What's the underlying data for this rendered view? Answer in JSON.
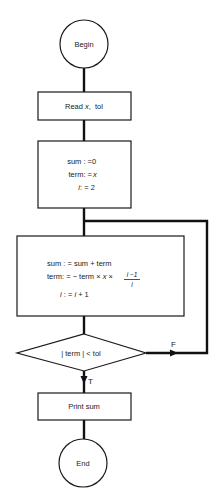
{
  "diagram": {
    "type": "flowchart",
    "nodes": {
      "begin": {
        "shape": "circle",
        "label": "Begin"
      },
      "read": {
        "shape": "process",
        "label_prefix": "Read ",
        "label_var": "x",
        "label_suffix": ",  tol"
      },
      "init": {
        "shape": "process",
        "lines": [
          {
            "lhs": "sum : = ",
            "rhs": "0"
          },
          {
            "lhs": "term: = ",
            "rhs": "x"
          },
          {
            "lhs": "i",
            "rhs": " : = 2"
          }
        ]
      },
      "loop": {
        "shape": "process",
        "line1": "sum : =  sum + term",
        "line2_prefix": "term: =  − term × ",
        "line2_var": "x",
        "line2_mid": " × ",
        "fraction_num": "i −1",
        "fraction_den": "i",
        "line3_var1": "i",
        "line3_mid": " : = ",
        "line3_var2": "i",
        "line3_suffix": " + 1"
      },
      "decision": {
        "shape": "diamond",
        "label": "| term | < tol"
      },
      "print": {
        "shape": "process",
        "label": "Print sum"
      },
      "end": {
        "shape": "circle",
        "label": "End"
      }
    },
    "edges": [
      {
        "from": "begin",
        "to": "read"
      },
      {
        "from": "read",
        "to": "init"
      },
      {
        "from": "init",
        "to": "loop"
      },
      {
        "from": "loop",
        "to": "decision"
      },
      {
        "from": "decision",
        "to": "print",
        "label": "T"
      },
      {
        "from": "decision",
        "to": "loop",
        "label": "F"
      },
      {
        "from": "print",
        "to": "end"
      }
    ],
    "edge_labels": {
      "true": "T",
      "false": "F"
    }
  }
}
